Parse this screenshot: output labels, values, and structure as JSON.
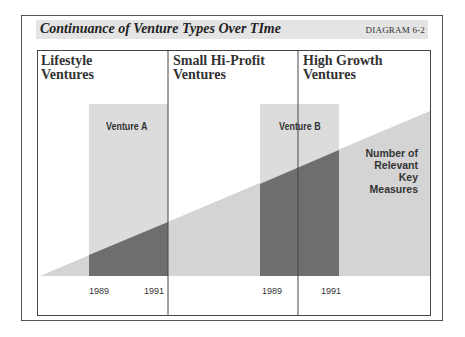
{
  "header": {
    "title": "Continuance of Venture Types Over TIme",
    "diagram_label": "DIAGRAM 6-2"
  },
  "columns": [
    {
      "line1": "Lifestyle",
      "line2": "Ventures"
    },
    {
      "line1": "Small Hi-Profit",
      "line2": "Ventures"
    },
    {
      "line1": "High Growth",
      "line2": "Ventures"
    }
  ],
  "ventures": [
    {
      "label": "Venture A",
      "start_year": "1989",
      "end_year": "1991"
    },
    {
      "label": "Venture B",
      "start_year": "1989",
      "end_year": "1991"
    }
  ],
  "measure_label": {
    "line1": "Number of",
    "line2": "Relevant",
    "line3": "Key Measures"
  },
  "colors": {
    "band": "#e4e4e4",
    "light_fill": "#d6d6d6",
    "dark_fill": "#6e6e6e",
    "border": "#444444"
  }
}
